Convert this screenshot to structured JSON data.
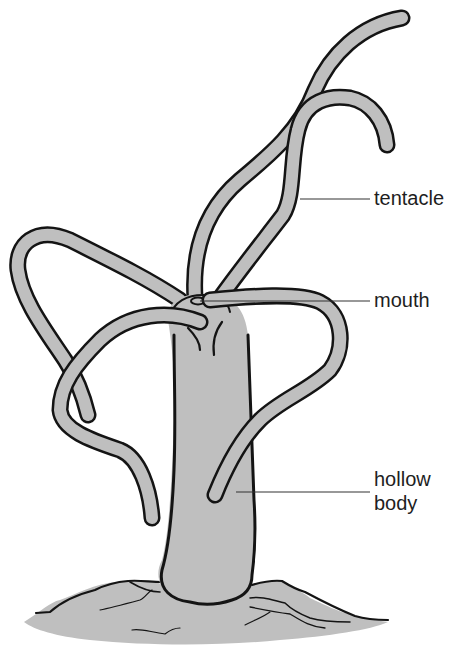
{
  "diagram": {
    "labels": {
      "tentacle": "tentacle",
      "mouth": "mouth",
      "hollow_body_line1": "hollow",
      "hollow_body_line2": "body"
    },
    "colors": {
      "fill": "#bfbfbf",
      "outline": "#141414",
      "leader_line": "#333333",
      "background": "#ffffff"
    }
  }
}
